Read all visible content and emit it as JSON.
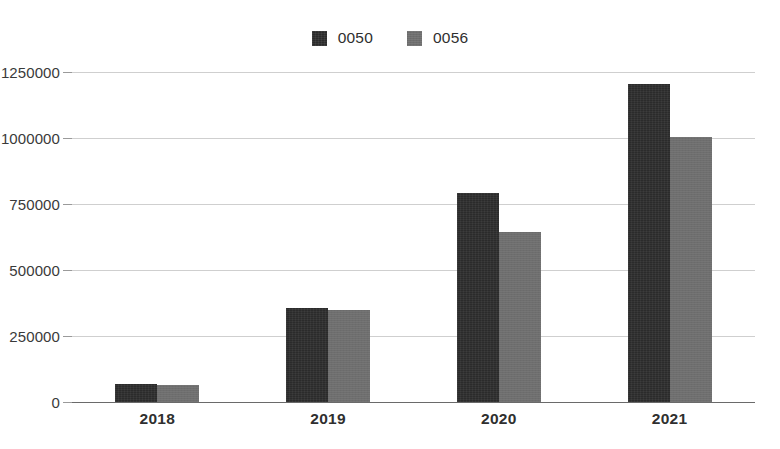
{
  "chart_data": {
    "type": "bar",
    "title": "",
    "subtitle": "",
    "xlabel": "",
    "ylabel": "",
    "categories": [
      "2018",
      "2019",
      "2020",
      "2021"
    ],
    "series": [
      {
        "name": "0050",
        "color": "#2b2b2b",
        "values": [
          68000,
          355000,
          790000,
          1205000
        ]
      },
      {
        "name": "0056",
        "color": "#6e6e6e",
        "values": [
          65000,
          348000,
          645000,
          1005000
        ]
      }
    ],
    "ylim": [
      0,
      1250000
    ],
    "yticks": [
      0,
      250000,
      500000,
      750000,
      1000000,
      1250000
    ],
    "ytick_labels": [
      "0",
      "250000",
      "500000",
      "750000",
      "1000000",
      "1250000"
    ],
    "grid": true,
    "grid_color": "#cfcfcf",
    "legend": {
      "position": "top-center",
      "entries": [
        {
          "label": "0050",
          "color": "#2b2b2b",
          "swatch": "legend-swatch-dark"
        },
        {
          "label": "0056",
          "color": "#6e6e6e",
          "swatch": "legend-swatch-gray"
        }
      ]
    },
    "axis": {
      "axis_color": "#6a6a6a",
      "tick_color": "#9a9a9a",
      "label_color": "#3a3a3a"
    },
    "background": "#ffffff"
  }
}
